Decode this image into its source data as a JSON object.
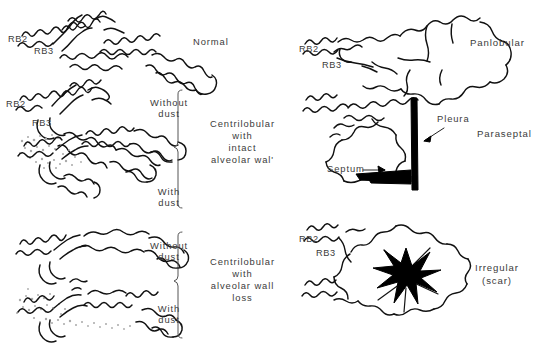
{
  "figure": {
    "width": 541,
    "height": 348,
    "ink_color": "#111111",
    "label_color": "#3b3b3b",
    "dust_color": "#a9a9a9",
    "background": "#ffffff"
  },
  "left_column": {
    "panels": [
      {
        "id": "normal",
        "category_label": "Normal",
        "dust_label": "",
        "airway_labels": [
          "RB2",
          "RB3"
        ]
      },
      {
        "id": "centrilobular-intact-without-dust",
        "category_label": "",
        "dust_label": "Without\ndust",
        "airway_labels": [
          "RB2",
          "RB3"
        ]
      },
      {
        "id": "centrilobular-intact-with-dust",
        "category_label": "",
        "dust_label": "With\ndust",
        "airway_labels": []
      },
      {
        "id": "centrilobular-loss-without-dust",
        "category_label": "",
        "dust_label": "Without\ndust",
        "airway_labels": []
      },
      {
        "id": "centrilobular-loss-with-dust",
        "category_label": "",
        "dust_label": "With\ndust",
        "airway_labels": []
      }
    ],
    "group_labels": [
      {
        "id": "centrilobular-intact",
        "lines": [
          "Centrilobular",
          "with",
          "intact",
          "alveolar wall"
        ]
      },
      {
        "id": "centrilobular-loss",
        "lines": [
          "Centrilobular",
          "with",
          "alveolar wall",
          "loss"
        ]
      }
    ],
    "dust_labels": {
      "without": "Without\ndust",
      "with": "With\ndust"
    }
  },
  "right_column": {
    "panels": [
      {
        "id": "panlobular",
        "category_label": "Panlobular",
        "airway_labels": [
          "RB2",
          "RB3"
        ],
        "annotations": []
      },
      {
        "id": "paraseptal",
        "category_label": "Paraseptal",
        "airway_labels": [],
        "annotations": [
          "Pleura",
          "Septum"
        ]
      },
      {
        "id": "irregular-scar",
        "category_label": "Irregular\n(scar)",
        "category_lines": [
          "Irregular",
          "(scar)"
        ],
        "airway_labels": [
          "RB2",
          "RB3"
        ],
        "annotations": []
      }
    ]
  },
  "labels": {
    "normal": "Normal",
    "panlobular": "Panlobular",
    "paraseptal": "Paraseptal",
    "irregular_line1": "Irregular",
    "irregular_line2": "(scar)",
    "pleura": "Pleura",
    "septum": "Septum",
    "rb2": "RB2",
    "rb3": "RB3",
    "without_dust_line1": "Without",
    "without_dust_line2": "dust",
    "with_dust_line1": "With",
    "with_dust_line2": "dust",
    "centrilobular": "Centrilobular",
    "with": "with",
    "intact": "intact",
    "alveolar_wall": "alveolar wall",
    "alveolar_wall_apos": "alveolar wal'",
    "loss": "loss"
  }
}
